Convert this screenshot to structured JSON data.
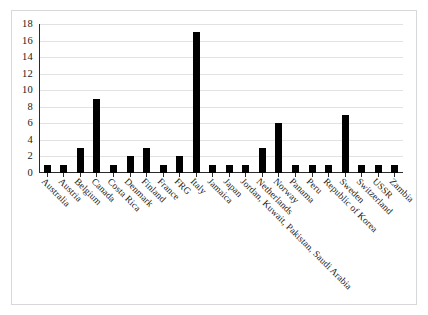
{
  "chart_data": {
    "type": "bar",
    "title": "",
    "subtitle": "",
    "xlabel": "",
    "ylabel": "",
    "ylim": [
      0,
      18
    ],
    "ytick_values": [
      0,
      2,
      4,
      6,
      8,
      10,
      12,
      14,
      16,
      18
    ],
    "ytick_labels": [
      "0",
      "2",
      "4",
      "6",
      "8",
      "10",
      "12",
      "14",
      "16",
      "18"
    ],
    "grid": true,
    "legend": "none",
    "bar_color": "#000000",
    "gridline_color": "#e2e2e2",
    "axis_color": "#2b2b2b",
    "categories": [
      "Australia",
      "Austria",
      "Belgium",
      "Canada",
      "Costa Rica",
      "Denmark",
      "Finland",
      "France",
      "FRG",
      "Italy",
      "Jamaica",
      "Japan",
      "Jordan, Kuwait, Pakistan, Saudi Arabia",
      "Netherlands",
      "Norway",
      "Panama",
      "Peru",
      "Republic of Korea",
      "Sweden",
      "Switzerland",
      "USSR",
      "Zambia"
    ],
    "values": [
      1,
      1,
      3,
      9,
      1,
      2,
      3,
      1,
      2,
      17,
      1,
      1,
      1,
      3,
      6,
      1,
      1,
      1,
      7,
      1,
      1,
      1
    ]
  }
}
